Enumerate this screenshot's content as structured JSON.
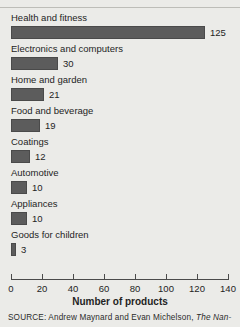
{
  "chart_data": {
    "type": "bar",
    "orientation": "horizontal",
    "title": "",
    "subtitle": "",
    "xlabel": "Number of products",
    "ylabel": "",
    "xlim": [
      0,
      140
    ],
    "xticks": [
      0,
      20,
      40,
      60,
      80,
      100,
      120,
      140
    ],
    "grid": false,
    "legend": null,
    "categories": [
      "Health and fitness",
      "Electronics and computers",
      "Home and garden",
      "Food and beverage",
      "Coatings",
      "Automotive",
      "Appliances",
      "Goods for children"
    ],
    "values": [
      125,
      30,
      21,
      19,
      12,
      10,
      10,
      3
    ],
    "value_labels": [
      "125",
      "30",
      "21",
      "19",
      "12",
      "10",
      "10",
      "3"
    ],
    "bar_color": "#5c5c5c",
    "background_color": "#ebebe8",
    "text_color": "#242424"
  },
  "source": {
    "prefix": "SOURCE:",
    "authors": "Andrew Maynard and Evan Michelson,",
    "italic_title": "The Nan-"
  }
}
